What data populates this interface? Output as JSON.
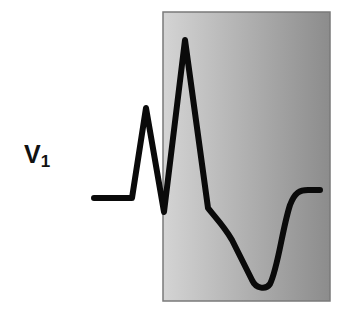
{
  "diagram": {
    "lead_label": "V",
    "lead_subscript": "1",
    "highlight_box": {
      "x": 163,
      "y": 12,
      "width": 167,
      "height": 289,
      "fill_left": "#d4d4d4",
      "fill_right": "#8c8c8c",
      "border": "#7a7a7a"
    },
    "waveform": {
      "stroke": "#0a0a0a",
      "stroke_width": 6,
      "path": "M94,198 L132,198 L146,108 L164,212 L185,40 L208,208 C214,216 224,226 232,240 L252,280 C256,289 266,290 270,284 C278,268 282,230 290,205 C295,192 300,190 308,190 L320,190"
    }
  }
}
